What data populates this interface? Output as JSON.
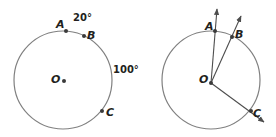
{
  "figure_left": {
    "description": "Circle with center O and points A, B, C marked on the circumference; arc measures labeled",
    "center_label": "O",
    "points": [
      {
        "label": "A"
      },
      {
        "label": "B"
      },
      {
        "label": "C"
      }
    ],
    "arc_labels": {
      "arc_AB": "20°",
      "arc_BC": "100°"
    }
  },
  "figure_right": {
    "description": "Same circle with rays drawn from center O through A, B, and C",
    "center_label": "O",
    "points": [
      {
        "label": "A"
      },
      {
        "label": "B"
      },
      {
        "label": "C"
      }
    ]
  },
  "colors": {
    "circle": "#808080",
    "points": "#3a3a3a",
    "rays": "#4d4d4d",
    "text": "#231f20"
  }
}
